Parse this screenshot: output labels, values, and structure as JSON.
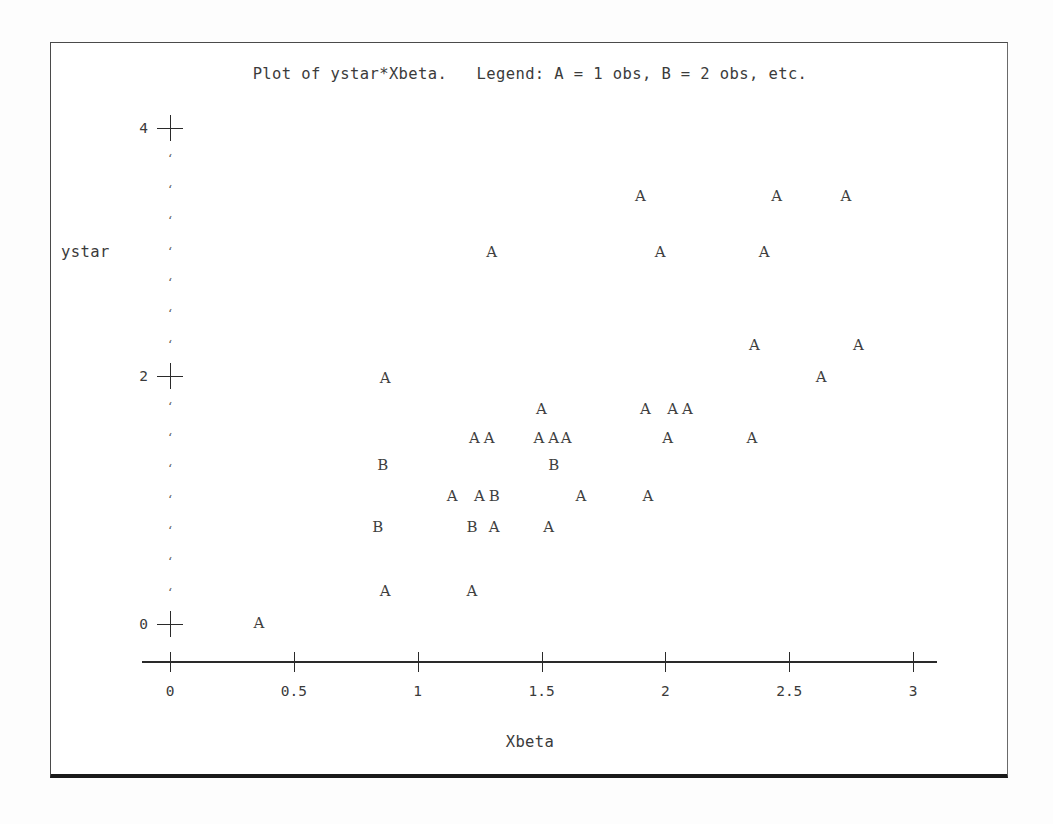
{
  "plot": {
    "title": "Plot of ystar*Xbeta.   Legend: A = 1 obs, B = 2 obs, etc.",
    "xlabel": "Xbeta",
    "ylabel": "ystar"
  },
  "chart_data": {
    "type": "scatter",
    "title": "Plot of ystar*Xbeta.   Legend: A = 1 obs, B = 2 obs, etc.",
    "xlabel": "Xbeta",
    "ylabel": "ystar",
    "legend": "A = 1 obs, B = 2 obs, etc.",
    "grid": false,
    "xlim": [
      -0.08,
      3.05
    ],
    "ylim": [
      -0.1,
      4.1
    ],
    "xticks": [
      0,
      0.5,
      1,
      1.5,
      2,
      2.5,
      3
    ],
    "xtick_labels": [
      "0",
      "0.5",
      "1",
      "1.5",
      "2",
      "2.5",
      "3"
    ],
    "yticks": [
      0,
      2,
      4
    ],
    "ytick_labels": [
      "0",
      "2",
      "4"
    ],
    "y_minor_ticks_per_interval": 7,
    "marker_legend": {
      "A": 1,
      "B": 2
    },
    "points": [
      {
        "x": 1.9,
        "y": 3.45,
        "label": "A"
      },
      {
        "x": 2.45,
        "y": 3.45,
        "label": "A"
      },
      {
        "x": 2.73,
        "y": 3.45,
        "label": "A"
      },
      {
        "x": 1.3,
        "y": 3.0,
        "label": "A"
      },
      {
        "x": 1.98,
        "y": 3.0,
        "label": "A"
      },
      {
        "x": 2.4,
        "y": 3.0,
        "label": "A"
      },
      {
        "x": 2.36,
        "y": 2.25,
        "label": "A"
      },
      {
        "x": 2.78,
        "y": 2.25,
        "label": "A"
      },
      {
        "x": 2.63,
        "y": 1.99,
        "label": "A"
      },
      {
        "x": 0.87,
        "y": 1.98,
        "label": "A"
      },
      {
        "x": 1.5,
        "y": 1.73,
        "label": "A"
      },
      {
        "x": 1.92,
        "y": 1.73,
        "label": "A"
      },
      {
        "x": 2.03,
        "y": 1.73,
        "label": "A"
      },
      {
        "x": 2.09,
        "y": 1.73,
        "label": "A"
      },
      {
        "x": 1.23,
        "y": 1.5,
        "label": "A"
      },
      {
        "x": 1.29,
        "y": 1.5,
        "label": "A"
      },
      {
        "x": 1.49,
        "y": 1.5,
        "label": "A"
      },
      {
        "x": 1.55,
        "y": 1.5,
        "label": "A"
      },
      {
        "x": 1.6,
        "y": 1.5,
        "label": "A"
      },
      {
        "x": 2.01,
        "y": 1.5,
        "label": "A"
      },
      {
        "x": 2.35,
        "y": 1.5,
        "label": "A"
      },
      {
        "x": 0.86,
        "y": 1.28,
        "label": "B"
      },
      {
        "x": 1.55,
        "y": 1.28,
        "label": "B"
      },
      {
        "x": 1.14,
        "y": 1.03,
        "label": "A"
      },
      {
        "x": 1.25,
        "y": 1.03,
        "label": "A"
      },
      {
        "x": 1.31,
        "y": 1.03,
        "label": "B"
      },
      {
        "x": 1.66,
        "y": 1.03,
        "label": "A"
      },
      {
        "x": 1.93,
        "y": 1.03,
        "label": "A"
      },
      {
        "x": 0.84,
        "y": 0.78,
        "label": "B"
      },
      {
        "x": 1.22,
        "y": 0.78,
        "label": "B"
      },
      {
        "x": 1.31,
        "y": 0.78,
        "label": "A"
      },
      {
        "x": 1.53,
        "y": 0.78,
        "label": "A"
      },
      {
        "x": 0.87,
        "y": 0.27,
        "label": "A"
      },
      {
        "x": 1.22,
        "y": 0.27,
        "label": "A"
      },
      {
        "x": 0.36,
        "y": 0.01,
        "label": "A"
      }
    ]
  }
}
